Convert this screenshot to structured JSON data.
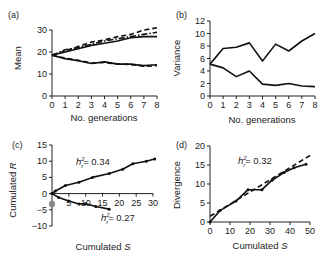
{
  "chart_data": [
    {
      "panel": "(a)",
      "type": "line",
      "xlabel": "No. generations",
      "ylabel": "Mean",
      "xlim": [
        0,
        8
      ],
      "ylim": [
        0,
        30
      ],
      "xticks": [
        "0",
        "1",
        "2",
        "3",
        "4",
        "5",
        "6",
        "7",
        "8"
      ],
      "yticks": [
        "0",
        "10",
        "20",
        "30"
      ],
      "grid": false,
      "x": [
        0,
        1,
        2,
        3,
        4,
        5,
        6,
        7,
        8
      ],
      "series": [
        {
          "name": "up-dashed",
          "style": "dashed",
          "values": [
            18.5,
            20.5,
            22.5,
            24.5,
            25.5,
            27,
            28,
            30,
            31
          ]
        },
        {
          "name": "up-dashdot",
          "style": "dashdot",
          "values": [
            18.5,
            21,
            22,
            23.5,
            25,
            26,
            27,
            28,
            29
          ]
        },
        {
          "name": "up-solid",
          "style": "solid",
          "values": [
            18.5,
            20,
            21.5,
            23,
            24,
            25,
            26.5,
            27,
            27
          ]
        },
        {
          "name": "down-solid",
          "style": "solid",
          "values": [
            18.5,
            17,
            16,
            14.8,
            15.5,
            14.5,
            14.5,
            13.8,
            14.2
          ]
        },
        {
          "name": "down-dashed",
          "style": "dashed",
          "values": [
            18.5,
            17.2,
            16.2,
            15,
            15.2,
            14.6,
            14.3,
            13.5,
            13.8
          ]
        }
      ]
    },
    {
      "panel": "(b)",
      "type": "line",
      "xlabel": "No. generations",
      "ylabel": "Variance",
      "xlim": [
        0,
        8
      ],
      "ylim": [
        0,
        12
      ],
      "xticks": [
        "0",
        "1",
        "2",
        "3",
        "4",
        "5",
        "6",
        "7",
        "8"
      ],
      "yticks": [
        "0",
        "2",
        "4",
        "6",
        "8",
        "10",
        "12"
      ],
      "grid": false,
      "x": [
        0,
        1,
        2,
        3,
        4,
        5,
        6,
        7,
        8
      ],
      "series": [
        {
          "name": "upper",
          "values": [
            5.1,
            7.6,
            7.8,
            8.5,
            5.6,
            8.3,
            7.2,
            8.8,
            10
          ]
        },
        {
          "name": "lower",
          "values": [
            5.1,
            4.5,
            3.1,
            4.0,
            1.9,
            1.7,
            2.0,
            1.6,
            1.5
          ]
        }
      ]
    },
    {
      "panel": "(c)",
      "type": "line",
      "xlabel": "Cumulated S",
      "ylabel": "Cumulated R",
      "xlim": [
        0,
        30
      ],
      "ylim": [
        -10,
        15
      ],
      "xticks": [
        "5",
        "10",
        "15",
        "20",
        "25",
        "30"
      ],
      "yticks": [
        "-10",
        "-5",
        "0",
        "5",
        "10",
        "15"
      ],
      "grid": false,
      "series": [
        {
          "name": "upward selection",
          "x": [
            0,
            1,
            4,
            8,
            12,
            17,
            21,
            24,
            28,
            30.5
          ],
          "values": [
            0,
            0.8,
            2.5,
            3.5,
            5,
            6.2,
            7.5,
            9.2,
            10,
            10.7
          ]
        },
        {
          "name": "downward selection",
          "x": [
            0,
            2,
            5,
            8,
            10,
            13,
            17
          ],
          "values": [
            0,
            -1.2,
            -2.3,
            -3.2,
            -3.1,
            -4,
            -4.8
          ]
        }
      ],
      "annotations": [
        {
          "text": "h_r^2 = 0.34",
          "x": 17,
          "y": 10
        },
        {
          "text": "h_r^2 = 0.27",
          "x": 22,
          "y": -6.5
        }
      ]
    },
    {
      "panel": "(d)",
      "type": "line",
      "xlabel": "Cumulated S",
      "ylabel": "Divergence",
      "xlim": [
        0,
        50
      ],
      "ylim": [
        0,
        20
      ],
      "xticks": [
        "0",
        "10",
        "20",
        "30",
        "40",
        "50"
      ],
      "yticks": [
        "0",
        "5",
        "10",
        "15",
        "20"
      ],
      "grid": false,
      "series": [
        {
          "name": "observed",
          "style": "solid",
          "x": [
            0,
            5,
            13,
            19,
            26,
            31,
            37,
            42,
            48
          ],
          "values": [
            0,
            3,
            5.5,
            8.5,
            8.5,
            11,
            13,
            14.3,
            15.2
          ]
        },
        {
          "name": "regression",
          "style": "dashed",
          "x": [
            0,
            50
          ],
          "values": [
            1.5,
            17.5
          ]
        }
      ],
      "annotations": [
        {
          "text": "h_r^2 = 0.32",
          "x": 24,
          "y": 16
        }
      ]
    }
  ],
  "labels": {
    "a": "(a)",
    "b": "(b)",
    "c": "(c)",
    "d": "(d)",
    "a_xlabel": "No. generations",
    "a_ylabel": "Mean",
    "b_xlabel": "No. generations",
    "b_ylabel": "Variance",
    "c_xlabel_text": "Cumulated ",
    "c_xlabel_var": "S",
    "c_ylabel_text": "Cumulated ",
    "c_ylabel_var": "R",
    "d_xlabel_text": "Cumulated ",
    "d_xlabel_var": "S",
    "d_ylabel": "Divergence",
    "c_ann1_val": "= 0.34",
    "c_ann2_val": "= 0.27",
    "d_ann_val": "= 0.32"
  }
}
